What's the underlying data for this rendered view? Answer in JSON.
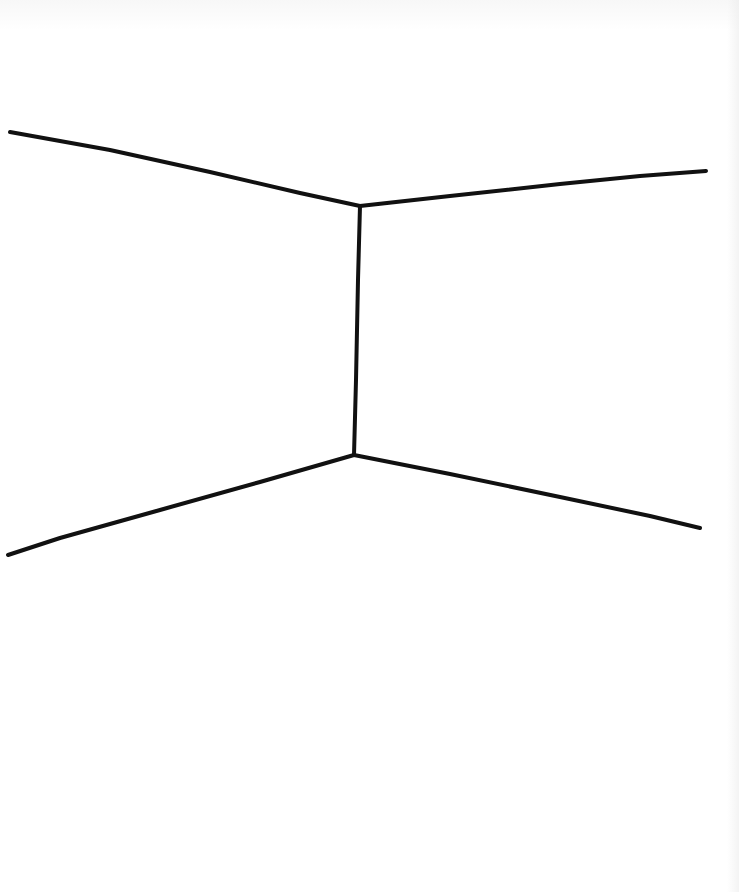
{
  "drawing": {
    "subject": "room-corner-line-drawing",
    "stroke_color": "#111111",
    "background_color": "#ffffff",
    "stroke_width": 4,
    "lines": [
      {
        "name": "ceiling-left-edge",
        "points": [
          [
            10,
            132
          ],
          [
            110,
            150
          ],
          [
            210,
            172
          ],
          [
            300,
            193
          ],
          [
            360,
            206
          ]
        ]
      },
      {
        "name": "ceiling-right-edge",
        "points": [
          [
            360,
            206
          ],
          [
            450,
            196
          ],
          [
            560,
            184
          ],
          [
            640,
            176
          ],
          [
            706,
            171
          ]
        ]
      },
      {
        "name": "wall-corner-vertical",
        "points": [
          [
            360,
            206
          ],
          [
            358,
            280
          ],
          [
            356,
            380
          ],
          [
            354,
            455
          ]
        ]
      },
      {
        "name": "floor-left-edge",
        "points": [
          [
            354,
            455
          ],
          [
            260,
            482
          ],
          [
            160,
            510
          ],
          [
            60,
            538
          ],
          [
            8,
            555
          ]
        ]
      },
      {
        "name": "floor-right-edge",
        "points": [
          [
            354,
            455
          ],
          [
            450,
            474
          ],
          [
            560,
            497
          ],
          [
            650,
            516
          ],
          [
            700,
            528
          ]
        ]
      }
    ]
  }
}
